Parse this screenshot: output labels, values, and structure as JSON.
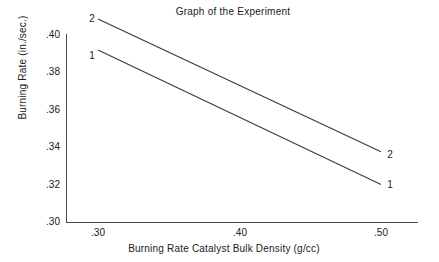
{
  "chart_data": {
    "type": "line",
    "title": "Graph of the Experiment",
    "xlabel": "Burning Rate Catalyst Bulk Density (g/cc)",
    "ylabel": "Burning Rate (in./sec.)",
    "xlim": [
      0.28,
      0.525
    ],
    "ylim": [
      0.3,
      0.4
    ],
    "xticks": [
      0.3,
      0.4,
      0.5
    ],
    "xticklabels": [
      ".30",
      ".40",
      ".50"
    ],
    "yticks": [
      0.3,
      0.32,
      0.34,
      0.36,
      0.38,
      0.4
    ],
    "yticklabels": [
      ".30",
      ".32",
      ".34",
      ".36",
      ".38",
      ".40"
    ],
    "grid": false,
    "legend_position": "line-end-labels",
    "x": [
      0.3,
      0.5
    ],
    "series": [
      {
        "name": "1",
        "label_left": "1",
        "label_right": "1",
        "values": [
          0.392,
          0.32
        ],
        "color": "#3a3a3a"
      },
      {
        "name": "2",
        "label_left": "2",
        "label_right": "2",
        "values": [
          0.4085,
          0.3375
        ],
        "color": "#3a3a3a"
      }
    ],
    "axis_color": "#4a4a4a",
    "background": "#ffffff",
    "text_color": "#20201f"
  },
  "ticks": {
    "y": [
      {
        "label": ".40",
        "top": 30
      },
      {
        "label": ".38",
        "top": 67
      },
      {
        "label": ".36",
        "top": 105
      },
      {
        "label": ".34",
        "top": 142
      },
      {
        "label": ".32",
        "top": 180
      },
      {
        "label": ".30",
        "top": 217
      }
    ],
    "x": [
      {
        "label": ".30",
        "left": 78
      },
      {
        "label": ".40",
        "left": 220
      },
      {
        "label": ".50",
        "left": 361
      }
    ]
  },
  "series_labels": [
    {
      "text": "2",
      "left": 86,
      "top": 14,
      "name": "series-2-label-left"
    },
    {
      "text": "1",
      "left": 86,
      "top": 51,
      "name": "series-1-label-left"
    },
    {
      "text": "2",
      "left": 384,
      "top": 150,
      "name": "series-2-label-right"
    },
    {
      "text": "1",
      "left": 384,
      "top": 180,
      "name": "series-1-label-right"
    }
  ]
}
